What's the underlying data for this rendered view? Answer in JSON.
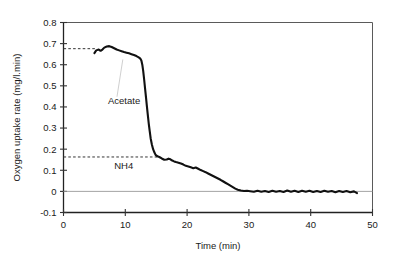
{
  "chart_data": {
    "type": "line",
    "title": "",
    "xlabel": "Time (min)",
    "ylabel": "Oxygen uptake rate (mg/l.min)",
    "xlim": [
      0,
      50
    ],
    "ylim": [
      -0.1,
      0.8
    ],
    "xticks": [
      0,
      10,
      20,
      30,
      40,
      50
    ],
    "xtick_labels": [
      "0",
      "10",
      "20",
      "30",
      "40",
      "50"
    ],
    "yticks": [
      -0.1,
      0,
      0.1,
      0.2,
      0.3,
      0.4,
      0.5,
      0.6,
      0.7,
      0.8
    ],
    "ytick_labels": [
      "-0.1",
      "0",
      "0.1",
      "0.2",
      "0.3",
      "0.4",
      "0.5",
      "0.6",
      "0.7",
      "0.8"
    ],
    "grid": false,
    "legend": "none",
    "series": [
      {
        "name": "Oxygen uptake rate",
        "color": "#111111",
        "x": [
          5.0,
          5.3,
          5.7,
          6.0,
          6.3,
          6.6,
          7.0,
          7.4,
          7.8,
          8.2,
          8.6,
          9.0,
          9.4,
          9.8,
          10.2,
          10.6,
          11.0,
          11.4,
          11.8,
          12.1,
          12.4,
          12.6,
          12.75,
          12.9,
          13.05,
          13.2,
          13.35,
          13.5,
          13.65,
          13.8,
          13.95,
          14.1,
          14.3,
          14.5,
          14.7,
          14.9,
          15.2,
          15.5,
          15.9,
          16.3,
          16.7,
          17.0,
          17.3,
          17.6,
          17.9,
          18.2,
          18.6,
          19.0,
          19.4,
          19.8,
          20.2,
          20.6,
          21.0,
          21.4,
          21.8,
          22.2,
          22.6,
          23.0,
          23.4,
          23.8,
          24.2,
          24.6,
          25.0,
          25.4,
          25.8,
          26.2,
          26.6,
          27.0,
          27.4,
          27.8,
          28.2,
          28.7,
          29.2,
          29.7,
          30.2,
          30.8,
          31.4,
          32.0,
          32.6,
          33.2,
          33.8,
          34.4,
          35.0,
          35.6,
          36.2,
          36.8,
          37.4,
          38.0,
          38.6,
          39.2,
          39.8,
          40.4,
          41.0,
          41.6,
          42.2,
          42.8,
          43.4,
          44.0,
          44.6,
          45.2,
          45.8,
          46.4,
          47.0,
          47.5
        ],
        "y": [
          0.655,
          0.668,
          0.672,
          0.666,
          0.672,
          0.681,
          0.686,
          0.688,
          0.684,
          0.678,
          0.672,
          0.668,
          0.664,
          0.66,
          0.657,
          0.654,
          0.65,
          0.646,
          0.641,
          0.636,
          0.63,
          0.62,
          0.6,
          0.57,
          0.53,
          0.487,
          0.445,
          0.402,
          0.36,
          0.32,
          0.285,
          0.252,
          0.222,
          0.2,
          0.185,
          0.173,
          0.166,
          0.163,
          0.156,
          0.15,
          0.151,
          0.155,
          0.152,
          0.146,
          0.142,
          0.139,
          0.136,
          0.132,
          0.127,
          0.121,
          0.118,
          0.114,
          0.11,
          0.113,
          0.107,
          0.101,
          0.096,
          0.091,
          0.085,
          0.079,
          0.073,
          0.067,
          0.061,
          0.055,
          0.048,
          0.041,
          0.034,
          0.027,
          0.02,
          0.013,
          0.008,
          0.004,
          0.002,
          0.003,
          0.001,
          -0.002,
          0.003,
          -0.002,
          0.002,
          -0.003,
          0.003,
          -0.002,
          0.002,
          -0.003,
          0.004,
          -0.002,
          0.003,
          -0.003,
          0.003,
          -0.002,
          0.003,
          -0.003,
          0.002,
          -0.003,
          0.003,
          -0.002,
          0.002,
          -0.004,
          0.002,
          -0.003,
          0.002,
          -0.004,
          0.0,
          -0.008
        ]
      }
    ],
    "reference_lines": [
      {
        "name": "acetate-level-line",
        "value": 0.676,
        "x_start": 0,
        "x_end": 5.1,
        "style": "dashed",
        "color": "#333333"
      },
      {
        "name": "nh4-level-line",
        "value": 0.163,
        "x_start": 0,
        "x_end": 15.4,
        "style": "dashed",
        "color": "#333333"
      },
      {
        "name": "zero-line",
        "value": 0,
        "x_start": 0,
        "x_end": 50,
        "style": "solid",
        "color": "#999999"
      }
    ],
    "annotations": [
      {
        "name": "acetate",
        "text": "Acetate",
        "x": 7.2,
        "y": 0.415,
        "leader_to_x": 9.6,
        "leader_to_y": 0.625
      },
      {
        "name": "nh4",
        "text": "NH4",
        "x": 8.2,
        "y": 0.105
      }
    ]
  },
  "axes": {
    "plot_border_color": "#222222",
    "tick_color": "#333333"
  }
}
